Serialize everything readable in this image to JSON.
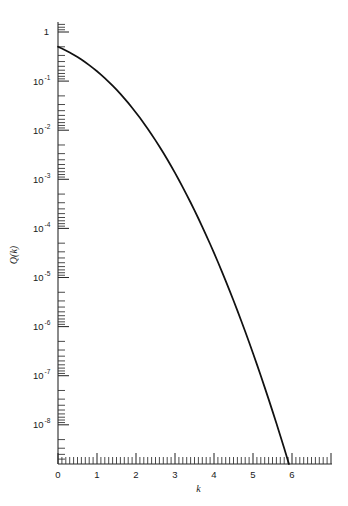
{
  "chart_data": {
    "type": "line",
    "title": "",
    "subtitle": "",
    "xlabel": "k",
    "ylabel": "Q(k)",
    "xlim": [
      0,
      7.0
    ],
    "ylim": [
      1e-09,
      1
    ],
    "yscale": "log",
    "xscale": "linear",
    "grid": false,
    "legend": null,
    "x_tick_labels": [
      "0",
      "1",
      "2",
      "3",
      "4",
      "5",
      "6"
    ],
    "x_tick_values": [
      0,
      1,
      2,
      3,
      4,
      5,
      6
    ],
    "x_minor_tick_step": 0.1,
    "y_tick_labels": [
      "1",
      "10⁻¹",
      "10⁻²",
      "10⁻³",
      "10⁻⁴",
      "10⁻⁵",
      "10⁻⁶",
      "10⁻⁷",
      "10⁻⁸"
    ],
    "y_tick_mantissa": [
      "1",
      "10",
      "10",
      "10",
      "10",
      "10",
      "10",
      "10",
      "10"
    ],
    "y_tick_exponent": [
      "",
      "-1",
      "-2",
      "-3",
      "-4",
      "-5",
      "-6",
      "-7",
      "-8"
    ],
    "y_tick_values": [
      1,
      0.1,
      0.01,
      0.001,
      0.0001,
      1e-05,
      1e-06,
      1e-07,
      1e-08
    ],
    "series": [
      {
        "name": "Q(k)",
        "color": "#111111",
        "x": [
          0.0,
          0.1,
          0.2,
          0.3,
          0.4,
          0.5,
          0.6,
          0.7,
          0.8,
          0.9,
          1.0,
          1.1,
          1.2,
          1.3,
          1.4,
          1.5,
          1.6,
          1.7,
          1.8,
          1.9,
          2.0,
          2.1,
          2.2,
          2.3,
          2.4,
          2.5,
          2.6,
          2.7,
          2.8,
          2.9,
          3.0,
          3.1,
          3.2,
          3.3,
          3.4,
          3.5,
          3.6,
          3.7,
          3.8,
          3.9,
          4.0,
          4.1,
          4.2,
          4.3,
          4.4,
          4.5,
          4.6,
          4.7,
          4.8,
          4.9,
          5.0,
          5.1,
          5.2,
          5.3,
          5.4,
          5.5,
          5.6,
          5.7,
          5.8,
          5.9,
          6.0,
          6.05,
          6.1
        ],
        "y": [
          0.5,
          0.46017,
          0.42074,
          0.38209,
          0.34458,
          0.30854,
          0.27425,
          0.24196,
          0.21186,
          0.18406,
          0.15866,
          0.13567,
          0.11507,
          0.0968,
          0.080757,
          0.066807,
          0.054799,
          0.044565,
          0.03593,
          0.028717,
          0.02275,
          0.017864,
          0.013903,
          0.010724,
          0.0081975,
          0.0062097,
          0.0046612,
          0.003467,
          0.0025551,
          0.0018658,
          0.0013499,
          0.0009676,
          0.00068714,
          0.00048342,
          0.00033693,
          0.00023263,
          0.00015911,
          0.0001078,
          7.2348e-05,
          4.8096e-05,
          3.1671e-05,
          2.0658e-05,
          1.3346e-05,
          8.5399e-06,
          5.4125e-06,
          3.3977e-06,
          2.1125e-06,
          1.3008e-06,
          7.9333e-07,
          4.7918e-07,
          2.8665e-07,
          1.6983e-07,
          9.9644e-08,
          5.7901e-08,
          3.332e-08,
          1.899e-08,
          1.0718e-08,
          5.9904e-09,
          3.3157e-09,
          1.8175e-09,
          9.8659e-10,
          7.2348e-10,
          5.3034e-10
        ]
      }
    ],
    "annotations": []
  },
  "figure": {
    "background_color": "#ffffff",
    "axis_color": "#2a2a2a",
    "curve_color": "#111111"
  }
}
